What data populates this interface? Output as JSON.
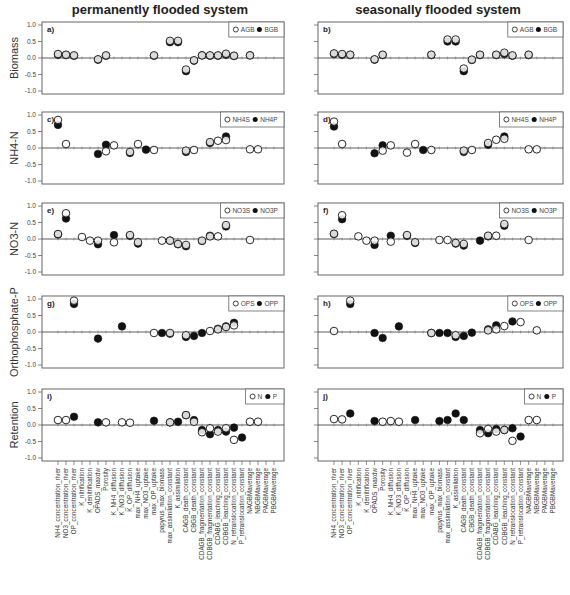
{
  "figure": {
    "column_titles": [
      "permanently flooded system",
      "seasonally flooded system"
    ],
    "row_ylabels": [
      "Biomass",
      "NH4-N",
      "NO3-N",
      "Orthophosphate-P",
      "Retention"
    ],
    "yticks": [
      "1.0",
      "0.5",
      "0.0",
      "-0.5",
      "-1.0"
    ],
    "colors": {
      "axis": "#555555",
      "marker_fill": "#111111",
      "marker_open": "#ffffff",
      "zero_line": "#333333"
    }
  },
  "chart_data": {
    "type": "scatter",
    "ylim": [
      -1.0,
      1.0
    ],
    "yticks": [
      1.0,
      0.5,
      0.0,
      -0.5,
      -1.0
    ],
    "grid": false,
    "legend_position": "upper right",
    "categories": [
      "NH4_concentration_river",
      "NO3_concentration_river",
      "OP_concentration_river",
      "K_nitrification",
      "K_denitrification",
      "OPADS_maxdw",
      "Porosity",
      "K_NH4_diffusion",
      "K_NO3_diffusion",
      "K_OP_diffusion",
      "max_NH4_uptake",
      "max_NO3_uptake",
      "max_OP_uptake",
      "papyrus_max_biomass",
      "max_assimilation_constant",
      "K_assimilation",
      "CAGB_death_constant",
      "CBGB_death_constant",
      "CDAGB_fragmentation_constant",
      "CDBGB_fragmentation_constant",
      "CDABG_leaching_constant",
      "CDBGB_leaching_constant",
      "N_retranslocation_constant",
      "P_retranslocation_constant",
      "NAGBMaverage",
      "NBGBMaverage",
      "PAGBMaverage",
      "PBGBMaverage"
    ],
    "panels": [
      {
        "id": "a",
        "system": "permanently flooded system",
        "ylabel": "Biomass",
        "legend": [
          "AGB",
          "BGB"
        ],
        "series": [
          {
            "name": "AGB",
            "marker": "open",
            "values": [
              0.12,
              0.1,
              0.08,
              null,
              null,
              -0.04,
              0.08,
              null,
              null,
              null,
              null,
              null,
              0.08,
              null,
              0.52,
              0.52,
              -0.35,
              -0.07,
              0.08,
              0.08,
              0.08,
              0.13,
              0.07,
              null,
              0.08,
              null,
              null,
              null
            ]
          },
          {
            "name": "BGB",
            "marker": "filled",
            "values": [
              0.1,
              0.09,
              0.07,
              null,
              null,
              -0.05,
              0.07,
              null,
              null,
              null,
              null,
              null,
              0.07,
              null,
              0.48,
              0.48,
              -0.4,
              -0.08,
              0.08,
              0.07,
              0.07,
              0.1,
              0.06,
              null,
              0.08,
              null,
              null,
              null
            ]
          }
        ]
      },
      {
        "id": "b",
        "system": "seasonally flooded system",
        "ylabel": "Biomass",
        "legend": [
          "AGB",
          "BGB"
        ],
        "series": [
          {
            "name": "AGB",
            "marker": "open",
            "values": [
              0.14,
              0.12,
              0.1,
              null,
              null,
              -0.04,
              0.1,
              null,
              null,
              null,
              null,
              null,
              0.1,
              null,
              0.56,
              0.56,
              -0.32,
              -0.05,
              0.1,
              null,
              0.1,
              0.16,
              0.08,
              null,
              0.1,
              null,
              null,
              null
            ]
          },
          {
            "name": "BGB",
            "marker": "filled",
            "values": [
              0.12,
              0.1,
              0.09,
              null,
              null,
              -0.05,
              0.09,
              null,
              null,
              null,
              null,
              null,
              0.09,
              null,
              0.5,
              0.5,
              -0.4,
              -0.06,
              0.09,
              null,
              0.09,
              0.12,
              0.07,
              null,
              0.09,
              null,
              null,
              null
            ]
          }
        ]
      },
      {
        "id": "c",
        "system": "permanently flooded system",
        "ylabel": "NH4-N",
        "legend": [
          "NH4S",
          "NH4P"
        ],
        "series": [
          {
            "name": "NH4S",
            "marker": "open",
            "values": [
              0.85,
              0.12,
              null,
              null,
              null,
              null,
              -0.1,
              0.08,
              null,
              -0.12,
              0.12,
              null,
              -0.06,
              null,
              null,
              null,
              -0.08,
              -0.06,
              null,
              0.18,
              0.22,
              0.24,
              null,
              null,
              -0.04,
              -0.04,
              null,
              null
            ]
          },
          {
            "name": "NH4P",
            "marker": "filled",
            "values": [
              0.7,
              null,
              null,
              null,
              null,
              -0.18,
              0.1,
              null,
              null,
              -0.15,
              null,
              -0.05,
              null,
              null,
              null,
              null,
              -0.12,
              null,
              null,
              0.15,
              null,
              0.35,
              null,
              null,
              null,
              null,
              null,
              null
            ]
          }
        ]
      },
      {
        "id": "d",
        "system": "seasonally flooded system",
        "ylabel": "NH4-N",
        "legend": [
          "NH4S",
          "NH4P"
        ],
        "series": [
          {
            "name": "NH4S",
            "marker": "open",
            "values": [
              0.8,
              0.12,
              null,
              null,
              null,
              null,
              -0.08,
              0.08,
              null,
              -0.14,
              0.12,
              null,
              -0.06,
              null,
              null,
              null,
              -0.08,
              -0.06,
              null,
              0.15,
              0.25,
              0.28,
              null,
              null,
              -0.04,
              -0.04,
              null,
              null
            ]
          },
          {
            "name": "NH4P",
            "marker": "filled",
            "values": [
              0.65,
              null,
              null,
              null,
              null,
              -0.16,
              0.08,
              null,
              null,
              null,
              null,
              -0.06,
              null,
              null,
              null,
              null,
              -0.12,
              null,
              null,
              0.1,
              null,
              0.35,
              null,
              null,
              null,
              null,
              null,
              null
            ]
          }
        ]
      },
      {
        "id": "e",
        "system": "permanently flooded system",
        "ylabel": "NO3-N",
        "legend": [
          "NO3S",
          "NO3P"
        ],
        "series": [
          {
            "name": "NO3S",
            "marker": "open",
            "values": [
              0.15,
              0.78,
              null,
              0.06,
              -0.05,
              -0.05,
              null,
              -0.1,
              null,
              0.12,
              -0.1,
              null,
              null,
              -0.05,
              -0.05,
              -0.15,
              -0.18,
              null,
              -0.05,
              0.08,
              0.08,
              0.42,
              null,
              null,
              -0.03,
              null,
              null,
              null
            ]
          },
          {
            "name": "NO3P",
            "marker": "filled",
            "values": [
              0.14,
              0.62,
              null,
              null,
              null,
              -0.16,
              null,
              0.12,
              null,
              0.1,
              -0.14,
              null,
              null,
              null,
              -0.05,
              -0.16,
              -0.22,
              null,
              -0.06,
              0.1,
              null,
              0.38,
              null,
              null,
              null,
              null,
              null,
              null
            ]
          }
        ]
      },
      {
        "id": "f",
        "system": "seasonally flooded system",
        "ylabel": "NO3-N",
        "legend": [
          "NO3S",
          "NO3P"
        ],
        "series": [
          {
            "name": "NO3S",
            "marker": "open",
            "values": [
              0.16,
              0.72,
              null,
              0.08,
              -0.05,
              -0.05,
              null,
              -0.08,
              null,
              0.12,
              -0.1,
              null,
              null,
              -0.03,
              -0.03,
              -0.12,
              -0.15,
              null,
              null,
              0.1,
              0.1,
              0.45,
              null,
              null,
              -0.03,
              null,
              null,
              null
            ]
          },
          {
            "name": "NO3P",
            "marker": "filled",
            "values": [
              0.15,
              0.6,
              null,
              null,
              null,
              -0.18,
              null,
              0.1,
              null,
              0.1,
              -0.12,
              null,
              null,
              null,
              null,
              -0.14,
              -0.2,
              null,
              -0.05,
              0.08,
              null,
              0.4,
              null,
              null,
              null,
              null,
              null,
              null
            ]
          }
        ]
      },
      {
        "id": "g",
        "system": "permanently flooded system",
        "ylabel": "Orthophosphate-P",
        "legend": [
          "OPS",
          "OPP"
        ],
        "series": [
          {
            "name": "OPS",
            "marker": "open",
            "values": [
              null,
              null,
              0.95,
              null,
              null,
              null,
              null,
              null,
              null,
              null,
              null,
              null,
              -0.03,
              null,
              -0.03,
              null,
              -0.1,
              null,
              null,
              0.03,
              0.08,
              0.15,
              0.2,
              null,
              null,
              null,
              null,
              null
            ]
          },
          {
            "name": "OPP",
            "marker": "filled",
            "values": [
              null,
              null,
              0.85,
              null,
              null,
              -0.2,
              null,
              null,
              0.17,
              null,
              null,
              null,
              null,
              -0.03,
              -0.05,
              null,
              -0.15,
              -0.12,
              -0.03,
              null,
              0.1,
              0.17,
              0.28,
              null,
              null,
              null,
              null,
              null
            ]
          }
        ]
      },
      {
        "id": "h",
        "system": "seasonally flooded system",
        "ylabel": "Orthophosphate-P",
        "legend": [
          "OPS",
          "OPP"
        ],
        "series": [
          {
            "name": "OPS",
            "marker": "open",
            "values": [
              0.03,
              null,
              0.95,
              null,
              null,
              null,
              null,
              null,
              null,
              null,
              null,
              null,
              -0.03,
              null,
              null,
              -0.1,
              null,
              null,
              null,
              0.05,
              0.08,
              0.18,
              null,
              0.3,
              null,
              0.05,
              null,
              null
            ]
          },
          {
            "name": "OPP",
            "marker": "filled",
            "values": [
              null,
              null,
              0.85,
              null,
              null,
              -0.03,
              -0.18,
              null,
              0.17,
              null,
              null,
              null,
              -0.03,
              -0.03,
              -0.03,
              -0.15,
              -0.12,
              -0.02,
              null,
              0.08,
              0.2,
              null,
              0.32,
              null,
              null,
              null,
              null,
              null
            ]
          }
        ]
      },
      {
        "id": "i",
        "system": "permanently flooded system",
        "ylabel": "Retention",
        "legend": [
          "N",
          "P"
        ],
        "series": [
          {
            "name": "N",
            "marker": "open",
            "values": [
              0.15,
              0.15,
              null,
              null,
              null,
              null,
              0.08,
              null,
              0.08,
              0.07,
              null,
              null,
              null,
              null,
              0.08,
              null,
              0.3,
              0.1,
              -0.22,
              -0.1,
              -0.2,
              -0.1,
              -0.45,
              null,
              0.1,
              0.1,
              null,
              null
            ]
          },
          {
            "name": "P",
            "marker": "filled",
            "values": [
              null,
              null,
              0.25,
              null,
              null,
              0.08,
              null,
              null,
              null,
              null,
              null,
              null,
              0.13,
              null,
              0.08,
              0.1,
              0.3,
              0.15,
              -0.15,
              -0.28,
              -0.15,
              -0.2,
              -0.08,
              -0.38,
              null,
              null,
              null,
              null
            ]
          }
        ]
      },
      {
        "id": "j",
        "system": "seasonally flooded system",
        "ylabel": "Retention",
        "legend": [
          "N",
          "P"
        ],
        "series": [
          {
            "name": "N",
            "marker": "open",
            "values": [
              0.18,
              0.17,
              null,
              null,
              null,
              null,
              0.1,
              0.12,
              0.1,
              null,
              null,
              null,
              null,
              null,
              null,
              null,
              null,
              null,
              -0.25,
              -0.12,
              -0.2,
              -0.15,
              -0.48,
              null,
              0.15,
              0.15,
              null,
              null
            ]
          },
          {
            "name": "P",
            "marker": "filled",
            "values": [
              null,
              null,
              0.35,
              null,
              null,
              0.12,
              null,
              null,
              null,
              null,
              0.15,
              null,
              null,
              0.12,
              0.15,
              0.35,
              0.15,
              null,
              -0.15,
              -0.25,
              -0.12,
              -0.15,
              -0.1,
              -0.35,
              null,
              null,
              null,
              null
            ]
          }
        ]
      }
    ]
  }
}
